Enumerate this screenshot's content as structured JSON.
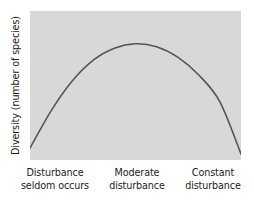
{
  "figure": {
    "background_color": "#ffffff",
    "panel_color": "#d8d8d8",
    "curve_color": "#555555"
  },
  "axes": {
    "y_label": "Diversity (number of species)",
    "x_labels": [
      {
        "line1": "Disturbance",
        "line2": "seldom occurs"
      },
      {
        "line1": "Moderate",
        "line2": "disturbance"
      },
      {
        "line1": "Constant",
        "line2": "disturbance"
      }
    ]
  },
  "chart_data": {
    "type": "line",
    "title": "",
    "xlabel": "",
    "ylabel": "Diversity (number of species)",
    "grid": false,
    "legend": null,
    "xlim": [
      0,
      1
    ],
    "ylim": [
      0,
      1
    ],
    "x_tick_labels": [
      "Disturbance seldom occurs",
      "Moderate disturbance",
      "Constant disturbance"
    ],
    "x_tick_positions": [
      0.12,
      0.51,
      0.87
    ],
    "series": [
      {
        "name": "Diversity",
        "x": [
          0.0,
          0.1,
          0.2,
          0.3,
          0.4,
          0.5,
          0.6,
          0.7,
          0.8,
          0.9,
          1.0
        ],
        "y": [
          0.08,
          0.33,
          0.53,
          0.67,
          0.75,
          0.78,
          0.76,
          0.69,
          0.57,
          0.39,
          0.04
        ]
      }
    ],
    "annotations": [
      "Intermediate disturbance hypothesis: diversity peaks at moderate disturbance"
    ]
  }
}
